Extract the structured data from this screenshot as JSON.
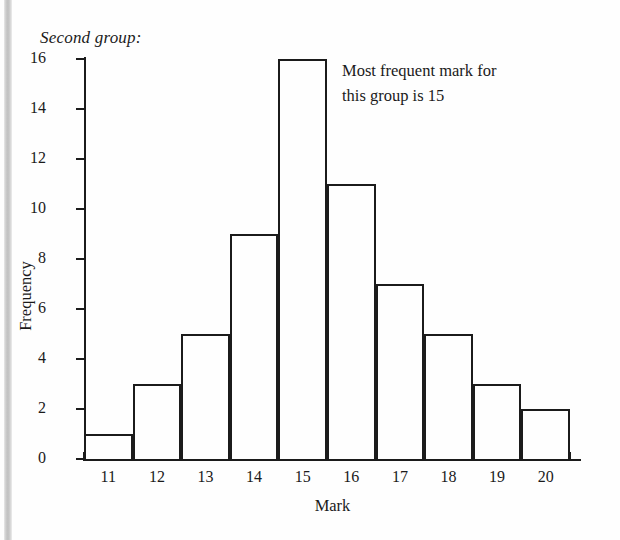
{
  "figure": {
    "title": "Second group:",
    "annotation_line1": "Most frequent mark for",
    "annotation_line2": "this group is 15",
    "ink_color": "#1b1b1b",
    "background_color": "#fefefe"
  },
  "chart_data": {
    "type": "bar",
    "title": "Second group:",
    "xlabel": "Mark",
    "ylabel": "Frequency",
    "categories": [
      "11",
      "12",
      "13",
      "14",
      "15",
      "16",
      "17",
      "18",
      "19",
      "20"
    ],
    "values": [
      1,
      3,
      5,
      9,
      16,
      11,
      7,
      5,
      3,
      2
    ],
    "ylim": [
      0,
      16
    ],
    "y_ticks": [
      "0",
      "2",
      "4",
      "6",
      "8",
      "10",
      "12",
      "14",
      "16"
    ],
    "y_tick_values": [
      0,
      2,
      4,
      6,
      8,
      10,
      12,
      14,
      16
    ],
    "xlim": [
      "10.5",
      "20.5"
    ],
    "grid": "off",
    "legend": "none",
    "annotations": [
      {
        "text": "Most frequent mark for this group is 15",
        "target_category": "15",
        "target_value": 16
      }
    ],
    "bar_style": "outlined-adjacent-histogram",
    "total_frequency": 62
  }
}
